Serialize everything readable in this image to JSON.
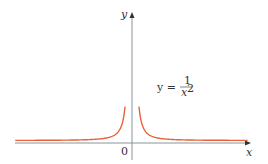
{
  "chart_data": {
    "type": "line",
    "title": "",
    "function_label": "y = 1/x²",
    "xlabel": "x",
    "ylabel": "y",
    "origin_label": "0",
    "series": [
      {
        "name": "y = 1/x^2",
        "color": "#e8603c",
        "description": "Graph of y = 1/x^2, symmetric about y-axis, vertical asymptote x=0, horizontal asymptote y=0"
      }
    ],
    "grid": false
  },
  "labels": {
    "y_axis": "y",
    "x_axis": "x",
    "origin": "0",
    "eq_lhs": "y =",
    "eq_num": "1",
    "eq_den": "x",
    "eq_exp": "2"
  },
  "colors": {
    "curve": "#e8603c",
    "axis": "#7f8c96"
  }
}
